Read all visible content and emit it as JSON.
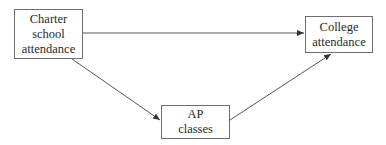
{
  "diagram": {
    "type": "path-diagram",
    "nodes": {
      "charter": {
        "label": "Charter\nschool\nattendance"
      },
      "college": {
        "label": "College\nattendance"
      },
      "ap": {
        "label": "AP\nclasses"
      }
    },
    "edges": [
      {
        "from": "Charter school attendance",
        "to": "College attendance"
      },
      {
        "from": "Charter school attendance",
        "to": "AP classes"
      },
      {
        "from": "AP classes",
        "to": "College attendance"
      }
    ],
    "colors": {
      "line": "#555555",
      "box_border": "#6e6e6e",
      "text": "#2a2a2a",
      "background": "#ffffff"
    }
  }
}
